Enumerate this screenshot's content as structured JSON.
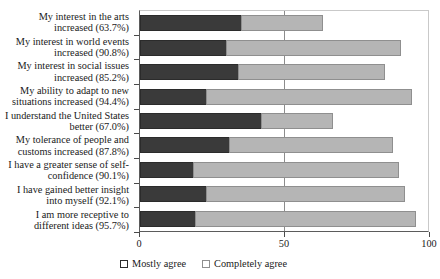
{
  "chart_data": {
    "type": "bar",
    "orientation": "horizontal",
    "stacked": true,
    "title": "",
    "xlabel": "",
    "ylabel": "",
    "xlim": [
      0,
      100
    ],
    "xticks": [
      0,
      50,
      100
    ],
    "xticklabels": [
      "0",
      "50",
      "100"
    ],
    "grid": false,
    "legend_position": "bottom-left",
    "categories": [
      "My interest in the arts increased (63.7%)",
      "My interest in world events increased (90.8%)",
      "My interest in social issues increased (85.2%)",
      "My ability to adapt to new situations increased (94.4%)",
      "I understand the United States better (67.0%)",
      "My tolerance of people and customs increased (87.8%)",
      "I have a greater sense of self-confidence (90.1%)",
      "I have gained better insight into myself (92.1%)",
      "I am more receptive to different ideas (95.7%)"
    ],
    "category_totals": [
      63.7,
      90.8,
      85.2,
      94.4,
      67.0,
      87.8,
      90.1,
      92.1,
      95.7
    ],
    "series": [
      {
        "name": "Mostly agree",
        "color": "#3a3a3a",
        "values": [
          35.0,
          30.0,
          34.0,
          23.0,
          42.0,
          31.0,
          18.5,
          23.0,
          19.0
        ]
      },
      {
        "name": "Completely agree",
        "color": "#b5b5b5",
        "values": [
          28.7,
          60.8,
          51.2,
          71.4,
          25.0,
          56.8,
          71.6,
          69.1,
          76.7
        ]
      }
    ]
  },
  "legend": {
    "items": [
      {
        "label": "Mostly agree",
        "color": "#3a3a3a"
      },
      {
        "label": "Completely agree",
        "color": "#b5b5b5"
      }
    ]
  }
}
